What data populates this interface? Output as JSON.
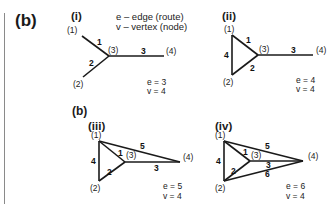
{
  "figure": {
    "main_label": "(b)",
    "sub_label": "(b)",
    "legend": {
      "edge": "e – edge (route)",
      "vertex": "v – vertex (node)"
    },
    "panels": [
      {
        "id": "i",
        "label": "(i)",
        "nodes": {
          "n1": "(1)",
          "n2": "(2)",
          "n3": "(3)",
          "n4": "(4)"
        },
        "edges": {
          "e1": "1",
          "e2": "2",
          "e3": "3"
        },
        "e_count": "e = 3",
        "v_count": "v = 4"
      },
      {
        "id": "ii",
        "label": "(ii)",
        "nodes": {
          "n1": "(1)",
          "n2": "(2)",
          "n3": "(3)",
          "n4": "(4)"
        },
        "edges": {
          "e1": "1",
          "e2": "2",
          "e3": "3",
          "e4": "4"
        },
        "e_count": "e = 4",
        "v_count": "v = 4"
      },
      {
        "id": "iii",
        "label": "(iii)",
        "nodes": {
          "n1": "(1)",
          "n2": "(2)",
          "n3": "(3)",
          "n4": "(4)"
        },
        "edges": {
          "e1": "1",
          "e2": "2",
          "e3": "3",
          "e4": "4",
          "e5": "5"
        },
        "e_count": "e = 5",
        "v_count": "v = 4"
      },
      {
        "id": "iv",
        "label": "(iv)",
        "nodes": {
          "n1": "(1)",
          "n2": "(2)",
          "n3": "(3)",
          "n4": "(4)"
        },
        "edges": {
          "e1": "1",
          "e2": "2",
          "e3": "3",
          "e4": "4",
          "e5": "5",
          "e6": "6"
        },
        "e_count": "e = 6",
        "v_count": "v = 4"
      }
    ]
  }
}
